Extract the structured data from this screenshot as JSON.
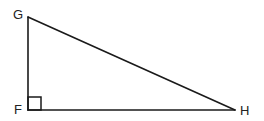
{
  "diagram": {
    "type": "right-triangle",
    "stroke_color": "#1a1a1a",
    "vertices": [
      {
        "name": "G",
        "x": 28,
        "y": 17,
        "label_x": 13,
        "label_y": 19
      },
      {
        "name": "F",
        "x": 28,
        "y": 110,
        "label_x": 14,
        "label_y": 114
      },
      {
        "name": "H",
        "x": 235,
        "y": 110,
        "label_x": 240,
        "label_y": 115
      }
    ],
    "sides": [
      {
        "from": "G",
        "to": "F"
      },
      {
        "from": "F",
        "to": "H"
      },
      {
        "from": "G",
        "to": "H"
      }
    ],
    "right_angle": {
      "vertex": "F",
      "marker_size": 13
    }
  }
}
